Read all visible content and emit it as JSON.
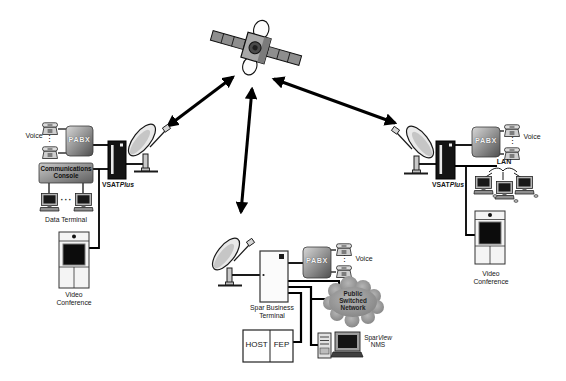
{
  "stations": {
    "left": {
      "voice": "Voice",
      "pabx": "PABX",
      "console_line1": "Communications",
      "console_line2": "Console",
      "vsat_name": "VSAT",
      "vsat_suffix": "Plus",
      "data_terminal": "Data Terminal",
      "video_line1": "Video",
      "video_line2": "Conference"
    },
    "right": {
      "voice": "Voice",
      "pabx": "PABX",
      "lan": "LAN",
      "vsat_name": "VSAT",
      "vsat_suffix": "Plus",
      "video_line1": "Video",
      "video_line2": "Conference"
    },
    "hub": {
      "terminal_line1": "Spar Business",
      "terminal_line2": "Terminal",
      "pabx": "PABX",
      "voice": "Voice",
      "cloud_line1": "Public",
      "cloud_line2": "Switched",
      "cloud_line3": "Network",
      "host": "HOST",
      "fep": "FEP",
      "nms_name": "Spar",
      "nms_suffix": "View",
      "nms_line2": "NMS"
    }
  },
  "symbols": {
    "vdots": "⋮",
    "hdots": "···"
  },
  "colors": {
    "line": "#000000",
    "gradient_box_dark": "#4f4f4f",
    "vsat_box": "#141414",
    "cloud_gray": "#9a9a9a",
    "background": "#ffffff"
  }
}
